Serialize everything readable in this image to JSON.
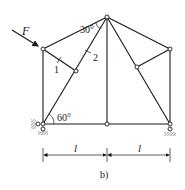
{
  "figure": {
    "caption": "b)",
    "force": {
      "label": "F"
    },
    "angles": {
      "top": "30°",
      "bottom": "60°"
    },
    "member_labels": {
      "m1": "1",
      "m2": "2"
    },
    "dimensions": [
      {
        "label": "l"
      },
      {
        "label": "l"
      }
    ],
    "colors": {
      "line": "#1a1a1a",
      "background": "#ffffff",
      "hatch": "#666666"
    },
    "nodes": {
      "A": [
        43,
        124
      ],
      "B": [
        107,
        124
      ],
      "C": [
        170,
        124
      ],
      "D": [
        43,
        49
      ],
      "E": [
        107,
        17
      ],
      "G": [
        170,
        49
      ],
      "H": [
        76,
        71
      ],
      "K": [
        137,
        67
      ]
    },
    "supports": {
      "left": "pin",
      "right": "roller"
    }
  }
}
